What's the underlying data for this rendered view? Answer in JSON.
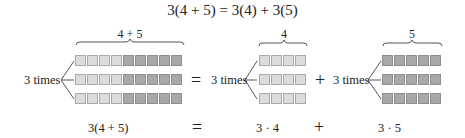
{
  "title": "3(4 + 5) = 3(4) + 3(5)",
  "colors": {
    "light_cell": "#dcdcdc",
    "dark_cell": "#a8a8a8",
    "text": "#222222"
  },
  "groups": [
    {
      "brace_label": "4 + 5",
      "times_label": "3 times",
      "rows": 3,
      "light_cells": 4,
      "dark_cells": 5
    },
    {
      "brace_label": "4",
      "times_label": "3 times",
      "rows": 3,
      "light_cells": 4,
      "dark_cells": 0
    },
    {
      "brace_label": "5",
      "times_label": "3 times",
      "rows": 3,
      "light_cells": 0,
      "dark_cells": 5
    }
  ],
  "operators": {
    "equals": "=",
    "plus": "+"
  },
  "bottom": {
    "left": "3(4 + 5)",
    "equals": "=",
    "middle": "3 · 4",
    "plus": "+",
    "right": "3 · 5"
  }
}
